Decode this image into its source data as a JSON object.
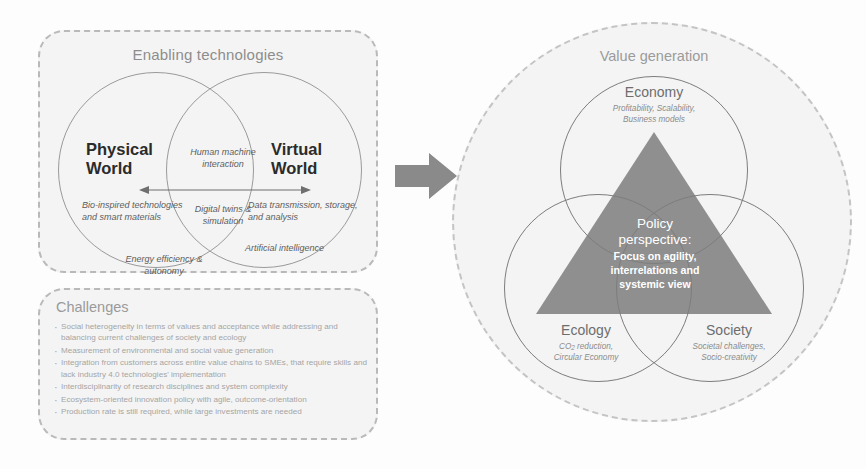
{
  "enabling": {
    "title": "Enabling technologies",
    "physical_world": "Physical\nWorld",
    "virtual_world": "Virtual\nWorld",
    "physical_note_1": "Bio-inspired technologies and smart materials",
    "physical_note_2": "Energy efficiency & autonomy",
    "virtual_note_1": "Data transmission, storage, and analysis",
    "virtual_note_2": "Artificial intelligence",
    "overlap_note_1": "Human machine interaction",
    "overlap_note_2": "Digital twins & simulation"
  },
  "challenges": {
    "title": "Challenges",
    "items": [
      "Social heterogeneity in terms of values and acceptance while addressing and balancing current challenges of society and ecology",
      "Measurement of environmental and social value generation",
      "Integration from customers across entire value chains to SMEs, that require skills and lack industry 4.0 technologies' implementation",
      "Interdisciplinarity of research disciplines and system complexity",
      "Ecosystem-oriented innovation policy with agile, outcome-orientation",
      "Production rate is still required, while large investments are needed"
    ]
  },
  "value_generation": {
    "title": "Value generation",
    "pillars": [
      {
        "name": "Economy",
        "sub": "Profitability, Scalability,\nBusiness models"
      },
      {
        "name": "Ecology",
        "sub": "CO₂ reduction,\nCircular Economy"
      },
      {
        "name": "Society",
        "sub": "Societal challenges,\nSocio-creativity"
      }
    ],
    "policy_head": "Policy\nperspective:",
    "policy_body": "Focus on agility,\ninterrelations and\nsystemic view"
  },
  "colors": {
    "panel_fill": "#f4f4f4",
    "dashed_border": "#b9b9b9",
    "title_gray": "#8d8d8d",
    "body_gray": "#a5a5a5",
    "circle_stroke": "#7d7d7d",
    "triangle_fill": "#8f8f8f",
    "arrow_gray": "#8a8a8a",
    "policy_text": "#ffffff"
  }
}
